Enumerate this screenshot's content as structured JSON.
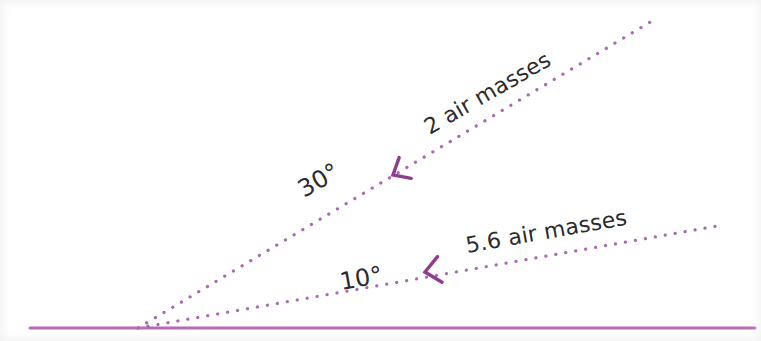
{
  "figure": {
    "kind": "angle-diagram",
    "background_color": "#ffffff",
    "horizon": {
      "name": "horizon-line",
      "color": "#b56cb5",
      "x1": 30,
      "y1": 328,
      "x2": 755,
      "y2": 328,
      "stroke_width": 3
    },
    "vertex": {
      "x": 138,
      "y": 328
    },
    "ray_color": "#a86bb0",
    "dot_radius": 1.6,
    "dot_spacing": 10,
    "arrow_color": "#8e3c8e",
    "rays": [
      {
        "id": "ray-30",
        "angle_label": "30°",
        "count_label": "2 air masses",
        "angle_degrees": 30,
        "air_masses": 2,
        "x1": 138,
        "y1": 328,
        "x2": 652,
        "y2": 21,
        "arrow": {
          "x": 393,
          "y": 175,
          "rotation": -30
        }
      },
      {
        "id": "ray-10",
        "angle_label": "10°",
        "count_label": "5.6 air masses",
        "angle_degrees": 10,
        "air_masses": 5.6,
        "x1": 138,
        "y1": 328,
        "x2": 723,
        "y2": 225,
        "arrow": {
          "x": 425,
          "y": 272,
          "rotation": -10
        }
      }
    ]
  },
  "labels": {
    "angle_30": "30°",
    "count_2": "2 air masses",
    "angle_10": "10°",
    "count_56": "5.6 air masses"
  },
  "chart_data": {
    "type": "diagram",
    "title": "",
    "xlabel": "",
    "ylabel": "",
    "categories": [
      "30°",
      "10°"
    ],
    "values": [
      2,
      5.6
    ],
    "series": [
      {
        "name": "air masses",
        "values": [
          2,
          5.6
        ]
      }
    ],
    "annotations": [
      "30°",
      "2 air masses",
      "10°",
      "5.6 air masses"
    ],
    "legend": false,
    "grid": false
  }
}
